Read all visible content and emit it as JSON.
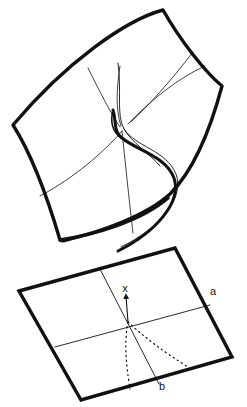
{
  "figure": {
    "name": "cusp-catastrophe-diagram",
    "background_color": "#ffffff",
    "ink_color": "#111111",
    "thick_stroke_width": 3.2,
    "thin_stroke_width": 0.8,
    "dotted_stroke_width": 1.1
  },
  "labels": {
    "control_axis_a": "a",
    "control_axis_b": "b",
    "behaviour_axis_x": "x"
  },
  "label_positions": {
    "a": {
      "x": 213,
      "y": 295
    },
    "b": {
      "x": 162,
      "y": 390
    },
    "x": {
      "x": 125,
      "y": 292
    }
  },
  "upper_surface": {
    "name": "behaviour-surface",
    "description": "Pleated equilibrium surface with a fold curve and cusp point",
    "corners": {
      "top": {
        "x": 163,
        "y": 10
      },
      "left": {
        "x": 13,
        "y": 125
      },
      "bottom": {
        "x": 62,
        "y": 240
      },
      "right": {
        "x": 222,
        "y": 85
      }
    },
    "outline_path": "M163,10 C120,21 62,60 13,125 C38,160 52,208 62,240 C96,234 142,222 166,200 C196,168 212,118 222,85 C205,74 180,40 163,10 Z",
    "fold_curve_path": "M112,62 C118,96 114,118 122,130 C133,146 162,148 172,172 C181,194 158,225 120,245",
    "fold_curve_secondary_path": "M152,160 C143,148 127,140 121,126 C113,108 117,84 120,66",
    "thin_grid_lines": [
      {
        "name": "upper-sheet-cross-line-right",
        "path": "M199,45 C176,73 150,103 130,123"
      },
      {
        "name": "upper-sheet-cross-line-left",
        "path": "M88,68 C103,96 113,118 120,129"
      },
      {
        "name": "upper-sheet-horizontal-rear",
        "path": "M200,44 C168,66 143,94 124,124"
      },
      {
        "name": "lower-sheet-line-left",
        "path": "M44,195 C78,176 105,152 122,132"
      },
      {
        "name": "lower-sheet-line-down",
        "path": "M123,133 C126,168 130,206 133,232"
      }
    ]
  },
  "lower_plane": {
    "name": "control-plane",
    "description": "Control parameter plane (a,b) carrying the cusp-shaped bifurcation set",
    "corners": {
      "left": {
        "x": 19,
        "y": 291
      },
      "top": {
        "x": 175,
        "y": 248
      },
      "right": {
        "x": 232,
        "y": 357
      },
      "bottom": {
        "x": 81,
        "y": 400
      }
    },
    "axis_lines": [
      {
        "name": "axis-a-line",
        "path": "M56,346 L209,305"
      },
      {
        "name": "axis-b-line",
        "path": "M100,270 L159,383"
      }
    ],
    "cusp_branches": [
      {
        "name": "cusp-branch-left",
        "path": "M128,322 C125,340 127,362 130,388"
      },
      {
        "name": "cusp-branch-right",
        "path": "M128,322 C143,336 163,352 186,366"
      }
    ],
    "behaviour_axis_arrow": {
      "path": "M128,322 L126,292",
      "arrowhead": true
    }
  },
  "semantics": {
    "diagram_type": "catastrophe-theory-cusp",
    "surface_label": "equilibrium surface",
    "projection_label": "bifurcation set"
  }
}
